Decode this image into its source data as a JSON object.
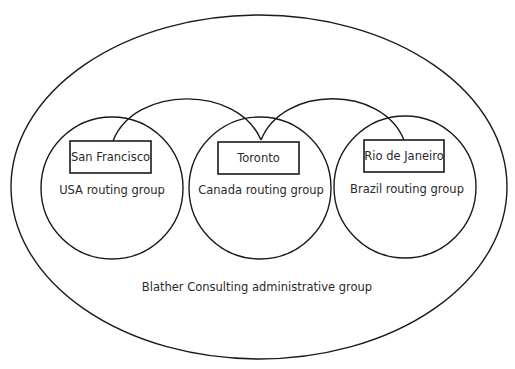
{
  "diagram": {
    "administrative_group": {
      "label": "Blather Consulting administrative group"
    },
    "routing_groups": [
      {
        "label": "USA routing group",
        "server": "San Francisco"
      },
      {
        "label": "Canada routing group",
        "server": "Toronto"
      },
      {
        "label": "Brazil routing group",
        "server": "Rio de Janeiro"
      }
    ],
    "connections": [
      {
        "from": "San Francisco",
        "to": "Toronto"
      },
      {
        "from": "Toronto",
        "to": "Rio de Janeiro"
      }
    ],
    "colors": {
      "stroke": "#1a1a1a",
      "text": "#2a2a2a",
      "background": "#ffffff"
    }
  }
}
